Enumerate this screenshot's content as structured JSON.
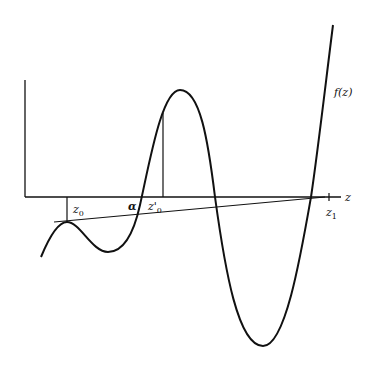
{
  "figure": {
    "type": "function-graph",
    "colors": {
      "stroke": "#111111",
      "background": "#ffffff"
    },
    "labels": {
      "function": "f(z)",
      "axis": "z",
      "z0": "z",
      "z0_sub": "0",
      "alpha": "α",
      "z0prime": "z'",
      "z0prime_sub": "0",
      "z1": "z",
      "z1_sub": "1"
    },
    "points": {
      "z0": {
        "x": 67,
        "y": 197
      },
      "alpha": {
        "x": 142,
        "y": 197
      },
      "z0prime": {
        "x": 163,
        "y": 197
      },
      "z1": {
        "x": 329,
        "y": 197
      }
    }
  }
}
